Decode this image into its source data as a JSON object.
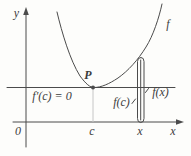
{
  "figure": {
    "colors": {
      "background": "#fdfdfb",
      "line": "#4b4b4b",
      "text": "#3c3c3c",
      "guide": "#c6c6c6"
    },
    "labels": {
      "y_axis": "y",
      "x_axis": "x",
      "origin": "0",
      "curve": "f",
      "point_p": "P",
      "derivative_at_c": "f′(c) = 0",
      "height_fc": "f(c)",
      "height_fx": "f(x)",
      "tick_c": "c",
      "tick_x": "x"
    }
  }
}
